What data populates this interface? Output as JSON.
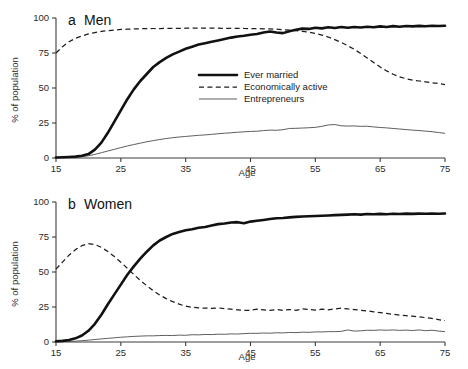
{
  "figure": {
    "background": "#ffffff",
    "axis_color": "#3d3d3d"
  },
  "legend": {
    "position": "inside-panel-a-center",
    "entries": [
      {
        "label": "Ever married",
        "style": "thick-solid",
        "color": "#111111"
      },
      {
        "label": "Economically active",
        "style": "dashed",
        "color": "#1c1c1c"
      },
      {
        "label": "Entrepreneurs",
        "style": "thin-solid",
        "color": "#555555"
      }
    ]
  },
  "panels": {
    "men": {
      "letter": "a",
      "title": "Men"
    },
    "women": {
      "letter": "b",
      "title": "Women"
    }
  },
  "chart_data": [
    {
      "type": "line",
      "id": "panel-a-men",
      "title": "a  Men",
      "panel_letter": "a",
      "panel_label": "Men",
      "xlabel": "Age",
      "ylabel": "% of population",
      "xlim": [
        15,
        75
      ],
      "ylim": [
        0,
        100
      ],
      "xticks": [
        15,
        25,
        35,
        45,
        55,
        65,
        75
      ],
      "yticks": [
        0,
        25,
        50,
        75,
        100
      ],
      "grid": false,
      "legend": [
        "Ever married",
        "Economically active",
        "Entrepreneurs"
      ],
      "legend_position": "center",
      "x": [
        15,
        16,
        17,
        18,
        19,
        20,
        21,
        22,
        23,
        24,
        25,
        26,
        27,
        28,
        29,
        30,
        31,
        32,
        33,
        34,
        35,
        36,
        37,
        38,
        39,
        40,
        41,
        42,
        43,
        44,
        45,
        46,
        47,
        48,
        49,
        50,
        51,
        52,
        53,
        54,
        55,
        56,
        57,
        58,
        59,
        60,
        61,
        62,
        63,
        64,
        65,
        66,
        67,
        68,
        69,
        70,
        71,
        72,
        73,
        74,
        75
      ],
      "series": [
        {
          "name": "Ever married",
          "style": "thick-solid",
          "values": [
            0.4,
            0.5,
            0.7,
            1.0,
            1.6,
            2.8,
            6.0,
            11.0,
            18.0,
            26.0,
            34.0,
            42.0,
            49.0,
            55.0,
            60.0,
            65.0,
            68.5,
            71.5,
            74.0,
            76.0,
            78.0,
            79.5,
            81.0,
            82.0,
            83.0,
            84.0,
            85.0,
            86.0,
            86.8,
            87.3,
            88.0,
            88.6,
            89.6,
            90.4,
            89.6,
            89.2,
            90.6,
            91.6,
            92.4,
            92.2,
            93.0,
            92.6,
            93.4,
            92.8,
            93.6,
            93.0,
            93.6,
            93.2,
            93.8,
            93.4,
            94.0,
            93.6,
            94.2,
            93.8,
            94.3,
            94.0,
            94.4,
            94.1,
            94.5,
            94.3,
            94.5
          ]
        },
        {
          "name": "Economically active",
          "style": "dashed",
          "values": [
            75.0,
            79.5,
            83.0,
            85.5,
            87.2,
            88.6,
            89.6,
            90.4,
            91.0,
            91.4,
            91.8,
            92.0,
            92.2,
            92.3,
            92.4,
            92.5,
            92.5,
            92.6,
            92.6,
            92.6,
            92.7,
            92.7,
            92.7,
            92.7,
            92.7,
            92.7,
            92.6,
            92.6,
            92.6,
            92.5,
            92.5,
            92.4,
            92.3,
            92.2,
            92.0,
            91.7,
            91.4,
            91.0,
            90.5,
            89.8,
            89.0,
            87.8,
            86.4,
            84.6,
            82.6,
            80.2,
            77.6,
            74.6,
            71.4,
            68.2,
            65.0,
            62.2,
            59.8,
            58.0,
            56.6,
            55.6,
            55.0,
            54.4,
            53.8,
            53.2,
            52.4
          ]
        },
        {
          "name": "Entrepreneurs",
          "style": "thin-solid",
          "values": [
            0.3,
            0.4,
            0.5,
            0.7,
            1.0,
            1.6,
            2.6,
            3.8,
            5.0,
            6.2,
            7.4,
            8.6,
            9.6,
            10.6,
            11.6,
            12.4,
            13.2,
            13.9,
            14.5,
            15.0,
            15.4,
            15.8,
            16.2,
            16.5,
            16.9,
            17.3,
            17.7,
            18.0,
            18.4,
            18.7,
            19.0,
            19.1,
            19.6,
            19.9,
            19.8,
            20.2,
            21.1,
            21.2,
            21.4,
            21.6,
            21.9,
            22.6,
            23.6,
            23.9,
            23.0,
            22.8,
            22.9,
            22.6,
            22.7,
            22.2,
            21.8,
            21.5,
            21.1,
            20.7,
            20.3,
            19.9,
            19.6,
            19.2,
            18.8,
            18.2,
            17.6
          ]
        }
      ]
    },
    {
      "type": "line",
      "id": "panel-b-women",
      "title": "b  Women",
      "panel_letter": "b",
      "panel_label": "Women",
      "xlabel": "Age",
      "ylabel": "% of population",
      "xlim": [
        15,
        75
      ],
      "ylim": [
        0,
        100
      ],
      "xticks": [
        15,
        25,
        35,
        45,
        55,
        65,
        75
      ],
      "yticks": [
        0,
        25,
        50,
        75,
        100
      ],
      "grid": false,
      "legend": [],
      "x": [
        15,
        16,
        17,
        18,
        19,
        20,
        21,
        22,
        23,
        24,
        25,
        26,
        27,
        28,
        29,
        30,
        31,
        32,
        33,
        34,
        35,
        36,
        37,
        38,
        39,
        40,
        41,
        42,
        43,
        44,
        45,
        46,
        47,
        48,
        49,
        50,
        51,
        52,
        53,
        54,
        55,
        56,
        57,
        58,
        59,
        60,
        61,
        62,
        63,
        64,
        65,
        66,
        67,
        68,
        69,
        70,
        71,
        72,
        73,
        74,
        75
      ],
      "series": [
        {
          "name": "Ever married",
          "style": "thick-solid",
          "values": [
            0.5,
            0.8,
            1.4,
            2.6,
            4.6,
            8.0,
            13.0,
            19.5,
            27.0,
            34.0,
            41.0,
            48.0,
            54.0,
            59.5,
            64.5,
            69.0,
            72.5,
            75.0,
            77.2,
            78.6,
            79.8,
            80.6,
            81.6,
            82.2,
            83.2,
            84.2,
            84.6,
            85.4,
            85.6,
            84.8,
            86.0,
            86.6,
            87.2,
            87.8,
            88.4,
            88.6,
            89.0,
            89.4,
            89.6,
            89.8,
            90.0,
            90.2,
            90.4,
            90.6,
            90.8,
            91.0,
            91.2,
            91.0,
            91.4,
            91.2,
            91.5,
            91.3,
            91.6,
            91.4,
            91.7,
            91.5,
            91.7,
            91.6,
            91.8,
            91.6,
            91.8
          ]
        },
        {
          "name": "Economically active",
          "style": "dashed",
          "values": [
            52.0,
            57.0,
            62.0,
            66.0,
            68.8,
            70.2,
            69.6,
            67.6,
            64.6,
            61.0,
            57.0,
            52.6,
            48.2,
            44.0,
            40.2,
            36.6,
            33.6,
            31.0,
            28.8,
            27.0,
            25.6,
            24.8,
            24.4,
            24.2,
            24.0,
            24.4,
            23.8,
            23.4,
            23.0,
            22.6,
            22.6,
            23.4,
            23.0,
            22.6,
            23.2,
            22.6,
            23.2,
            22.6,
            23.6,
            23.2,
            22.8,
            23.4,
            23.0,
            23.6,
            24.2,
            23.6,
            23.2,
            22.6,
            22.2,
            21.6,
            21.0,
            20.4,
            19.8,
            19.2,
            18.8,
            18.4,
            18.0,
            17.4,
            16.8,
            16.0,
            15.2
          ]
        },
        {
          "name": "Entrepreneurs",
          "style": "thin-solid",
          "values": [
            0.2,
            0.3,
            0.4,
            0.6,
            0.9,
            1.3,
            1.8,
            2.2,
            2.6,
            3.0,
            3.4,
            3.7,
            4.0,
            4.2,
            4.4,
            4.4,
            4.6,
            4.7,
            4.6,
            4.9,
            4.8,
            5.2,
            5.1,
            5.4,
            5.3,
            5.6,
            5.5,
            5.8,
            5.7,
            6.0,
            6.2,
            6.2,
            6.4,
            6.3,
            6.6,
            6.5,
            6.8,
            6.7,
            7.0,
            6.9,
            7.2,
            7.2,
            7.4,
            7.4,
            7.6,
            8.6,
            7.8,
            8.0,
            8.4,
            8.3,
            8.6,
            8.4,
            8.6,
            8.3,
            8.5,
            8.2,
            8.6,
            8.1,
            8.4,
            7.8,
            7.4
          ]
        }
      ]
    }
  ]
}
